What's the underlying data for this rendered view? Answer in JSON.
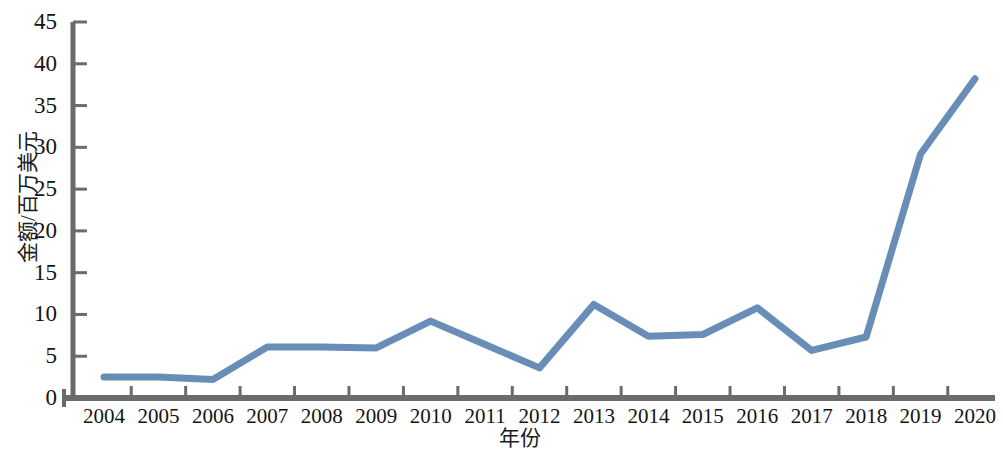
{
  "chart_data": {
    "type": "line",
    "title": "",
    "xlabel": "年份",
    "ylabel": "金额/百万美元",
    "categories": [
      "2004",
      "2005",
      "2006",
      "2007",
      "2008",
      "2009",
      "2010",
      "2011",
      "2012",
      "2013",
      "2014",
      "2015",
      "2016",
      "2017",
      "2018",
      "2019",
      "2020"
    ],
    "series": [
      {
        "name": "金额",
        "values": [
          2.5,
          2.5,
          2.2,
          6.1,
          6.1,
          6.0,
          9.2,
          6.4,
          3.6,
          11.2,
          7.4,
          7.6,
          10.8,
          5.7,
          7.3,
          29.2,
          38.2
        ]
      }
    ],
    "ylim": [
      0,
      45
    ],
    "yticks": [
      0,
      5,
      10,
      15,
      20,
      25,
      30,
      35,
      40,
      45
    ],
    "ytick_labels": [
      "0",
      "5",
      "10",
      "15",
      "20",
      "25",
      "30",
      "35",
      "40",
      "45"
    ],
    "grid": false,
    "legend": "none",
    "line_color": "#5b84b1",
    "axis_color": "#6b6b6b",
    "line_width": 7
  }
}
